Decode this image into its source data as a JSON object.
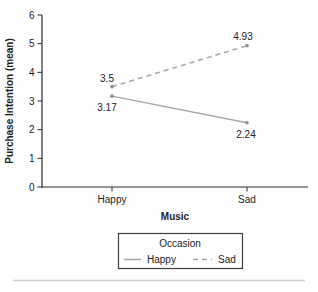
{
  "chart_data": {
    "type": "line",
    "title": "",
    "categories": [
      "Happy",
      "Sad"
    ],
    "series": [
      {
        "name": "Happy",
        "line_style": "solid",
        "values": [
          3.17,
          2.24
        ],
        "point_labels": [
          "3.17",
          "2.24"
        ]
      },
      {
        "name": "Sad",
        "line_style": "dashed",
        "values": [
          3.5,
          4.93
        ],
        "point_labels": [
          "3.5",
          "4.93"
        ]
      }
    ],
    "xlabel": "Music",
    "ylabel": "Purchase Intention (mean)",
    "ylim": [
      0,
      6
    ],
    "yticks": [
      "0",
      "1",
      "2",
      "3",
      "4",
      "5",
      "6"
    ],
    "grid": false,
    "legend": {
      "title": "Occasion",
      "position": "bottom",
      "entries": [
        "Happy",
        "Sad"
      ]
    }
  },
  "colors": {
    "series_line": "#a7a7a7",
    "marker": "#8f8f8f",
    "axis": "#2b2b2b",
    "text": "#222222",
    "legend_border": "#3f3f3f",
    "separator": "#cccccc",
    "background": "#fefefe"
  }
}
